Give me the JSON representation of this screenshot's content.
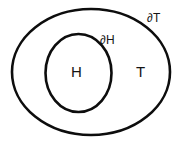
{
  "diagram": {
    "type": "nested-regions",
    "background_color": "#ffffff",
    "stroke_color": "#0d0d0d",
    "width": 182,
    "height": 144,
    "shapes": [
      {
        "name": "outer-boundary",
        "shape": "ellipse",
        "cx": 91,
        "cy": 72,
        "rx": 79,
        "ry": 63,
        "boundary_label": "∂T",
        "region_label": "T"
      },
      {
        "name": "inner-boundary",
        "shape": "ellipse",
        "cx": 78.5,
        "cy": 73,
        "rx": 33,
        "ry": 39,
        "boundary_label": "∂H",
        "region_label": "H"
      }
    ],
    "labels": {
      "inner_region": "H",
      "outer_region": "T",
      "inner_boundary": "∂H",
      "outer_boundary": "∂T"
    }
  }
}
